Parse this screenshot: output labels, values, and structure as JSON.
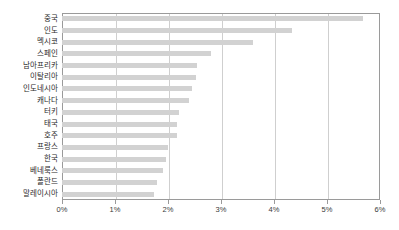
{
  "chart_data": {
    "type": "bar",
    "orientation": "horizontal",
    "title": "",
    "subtitle": "",
    "xlabel": "",
    "ylabel": "",
    "xlim": [
      0,
      6
    ],
    "xtick_labels": [
      "0%",
      "1%",
      "2%",
      "3%",
      "4%",
      "5%",
      "6%"
    ],
    "xticks": [
      0,
      1,
      2,
      3,
      4,
      5,
      6
    ],
    "unit": "%",
    "grid": "vertical",
    "legend": "none",
    "categories": [
      "중국",
      "인도",
      "멕시코",
      "스페인",
      "남아프리카",
      "이탈리아",
      "인도네시아",
      "캐나다",
      "터키",
      "태국",
      "호주",
      "프랑스",
      "한국",
      "베네룩스",
      "폴란드",
      "말레이시아"
    ],
    "values": [
      5.68,
      4.34,
      3.6,
      2.81,
      2.55,
      2.53,
      2.45,
      2.4,
      2.2,
      2.17,
      2.17,
      2.0,
      1.96,
      1.9,
      1.79,
      1.74
    ],
    "series": [
      {
        "name": "",
        "color": "#d2d2d2",
        "values": [
          5.68,
          4.34,
          3.6,
          2.81,
          2.55,
          2.53,
          2.45,
          2.4,
          2.2,
          2.17,
          2.17,
          2.0,
          1.96,
          1.9,
          1.79,
          1.74
        ]
      }
    ],
    "colors": {
      "bar": "#d2d2d2",
      "gridline": "#cfcfcf",
      "frame": "#9a9a9a",
      "label_text": "#2b2b2b",
      "background": "#ffffff"
    }
  }
}
